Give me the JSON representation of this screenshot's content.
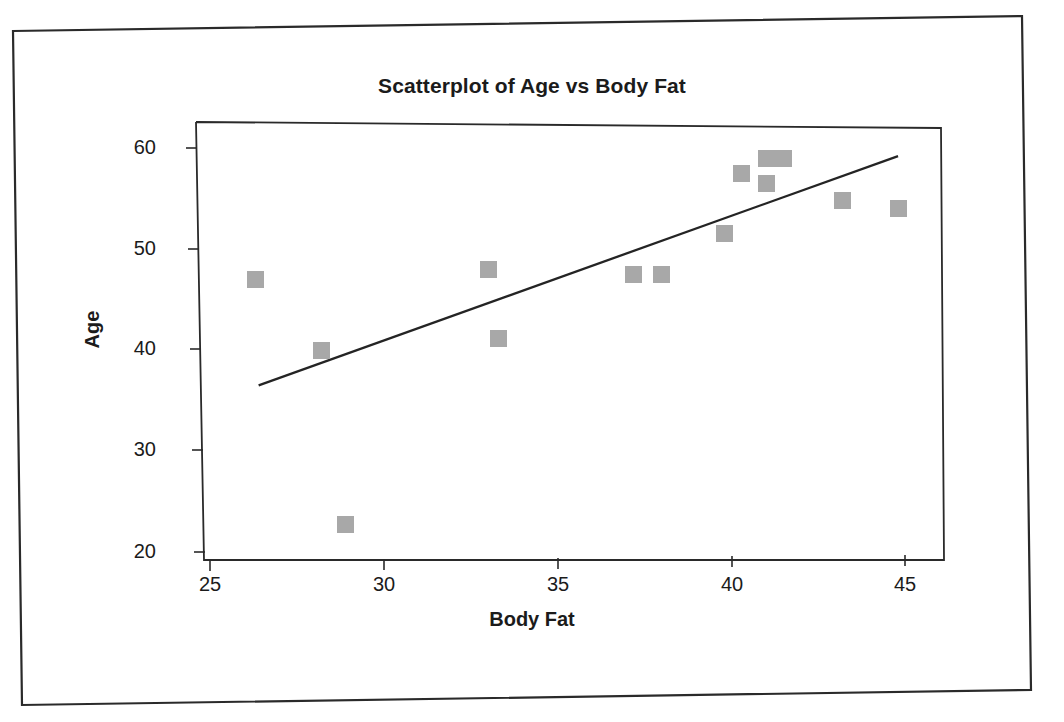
{
  "document": {
    "border_color": "#2a2a2a",
    "background": "#ffffff"
  },
  "chart_data": {
    "type": "scatter",
    "title": "Scatterplot of Age vs Body Fat",
    "xlabel": "Body Fat",
    "ylabel": "Age",
    "xlim": [
      24.0,
      45.9
    ],
    "ylim": [
      19.1,
      61.8
    ],
    "xticks": [
      25,
      30,
      35,
      40,
      45
    ],
    "yticks": [
      20,
      30,
      40,
      50,
      60
    ],
    "grid": false,
    "legend": null,
    "marker_color": "#a8a8a8",
    "marker_shape": "square",
    "points": [
      {
        "x": 26.3,
        "y": 47.0
      },
      {
        "x": 28.2,
        "y": 40.0
      },
      {
        "x": 28.9,
        "y": 22.7
      },
      {
        "x": 33.0,
        "y": 48.0
      },
      {
        "x": 33.3,
        "y": 41.1
      },
      {
        "x": 37.2,
        "y": 47.5
      },
      {
        "x": 38.0,
        "y": 47.5
      },
      {
        "x": 39.8,
        "y": 51.5
      },
      {
        "x": 40.3,
        "y": 57.5
      },
      {
        "x": 41.0,
        "y": 59.0
      },
      {
        "x": 41.5,
        "y": 59.0
      },
      {
        "x": 41.0,
        "y": 56.5
      },
      {
        "x": 43.2,
        "y": 54.8
      },
      {
        "x": 44.8,
        "y": 54.0
      }
    ],
    "trendline": {
      "type": "linear-fit",
      "color": "#242424",
      "x_start": 26.4,
      "y_start": 36.5,
      "x_end": 44.8,
      "y_end": 59.2
    }
  },
  "axis_tick_labels": {
    "y": [
      "60",
      "50",
      "40",
      "30",
      "20"
    ],
    "x": [
      "25",
      "30",
      "35",
      "40",
      "45"
    ]
  }
}
